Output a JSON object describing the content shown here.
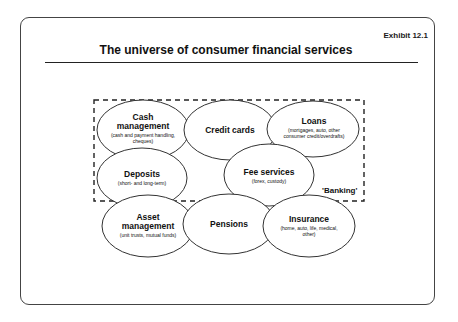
{
  "exhibit_label": "Exhibit 12.1",
  "title": "The universe of consumer financial services",
  "group_label": "'Banking'",
  "services": [
    {
      "id": "cash-management",
      "name": "Cash management",
      "detail": "(cash and payment handling, cheques)",
      "in_banking": true
    },
    {
      "id": "credit-cards",
      "name": "Credit cards",
      "detail": "",
      "in_banking": true
    },
    {
      "id": "loans",
      "name": "Loans",
      "detail": "(mortgages, auto, other consumer credit/overdrafts)",
      "in_banking": true
    },
    {
      "id": "deposits",
      "name": "Deposits",
      "detail": "(short- and long-term)",
      "in_banking": true
    },
    {
      "id": "fee-services",
      "name": "Fee services",
      "detail": "(forex, custody)",
      "in_banking": true
    },
    {
      "id": "asset-management",
      "name": "Asset management",
      "detail": "(unit trusts, mutual funds)",
      "in_banking": false
    },
    {
      "id": "pensions",
      "name": "Pensions",
      "detail": "",
      "in_banking": false
    },
    {
      "id": "insurance",
      "name": "Insurance",
      "detail": "(home, auto, life, medical, other)",
      "in_banking": false
    }
  ],
  "colors": {
    "stroke": "#222222",
    "background": "#ffffff"
  }
}
